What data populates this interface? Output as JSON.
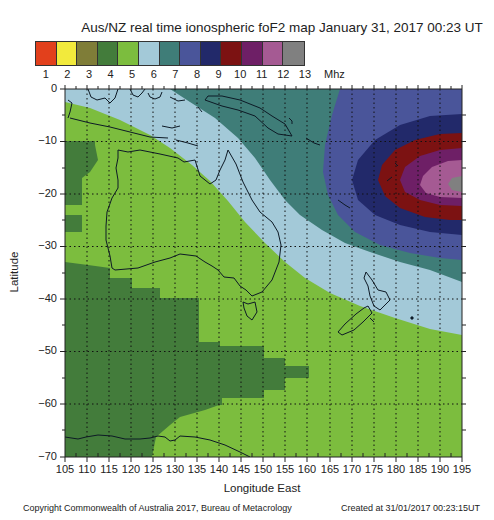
{
  "title": "Aus/NZ real time ionospheric foF2 map January 31, 2017 00:23 UT",
  "legend": {
    "unit": "Mhz",
    "items": [
      {
        "label": "1",
        "color": "#e2401c"
      },
      {
        "label": "2",
        "color": "#f2ea3c"
      },
      {
        "label": "3",
        "color": "#7f7d38"
      },
      {
        "label": "4",
        "color": "#437c3b"
      },
      {
        "label": "5",
        "color": "#7cbd3e"
      },
      {
        "label": "6",
        "color": "#a3c9d8"
      },
      {
        "label": "7",
        "color": "#3f7d78"
      },
      {
        "label": "8",
        "color": "#4a559a"
      },
      {
        "label": "9",
        "color": "#22296a"
      },
      {
        "label": "10",
        "color": "#7c1212"
      },
      {
        "label": "11",
        "color": "#6e1f66"
      },
      {
        "label": "12",
        "color": "#a55a93"
      },
      {
        "label": "13",
        "color": "#808080"
      }
    ]
  },
  "axes": {
    "y_title": "Latitude",
    "x_title": "Longitude East",
    "y_ticks": [
      "0",
      "−10",
      "−20",
      "−30",
      "−40",
      "−50",
      "−60",
      "−70"
    ],
    "x_ticks": [
      "105",
      "110",
      "115",
      "120",
      "125",
      "130",
      "135",
      "140",
      "145",
      "150",
      "155",
      "160",
      "165",
      "170",
      "175",
      "180",
      "185",
      "190",
      "195"
    ]
  },
  "footer": {
    "copyright": "Copyright Commonwealth of Australia 2017, Bureau of Metacrology",
    "created": "Created at 31/01/2017 00:23:15UT"
  }
}
